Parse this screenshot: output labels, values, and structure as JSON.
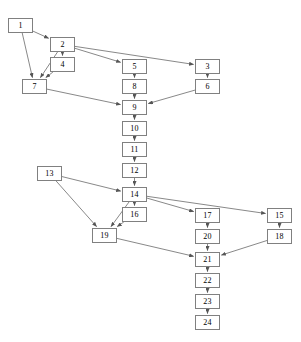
{
  "diagram": {
    "type": "directed-graph",
    "width": 301,
    "height": 342,
    "background_color": "#ffffff",
    "node_fill_color": "#ffffff",
    "node_border_color": "#808080",
    "edge_color": "#555555",
    "label_color": "#000000",
    "node_width": 25,
    "node_height": 15,
    "nodes": [
      {
        "id": "1",
        "label": "1",
        "x": 8,
        "y": 18
      },
      {
        "id": "2",
        "label": "2",
        "x": 50,
        "y": 37
      },
      {
        "id": "3",
        "label": "3",
        "x": 195,
        "y": 59
      },
      {
        "id": "4",
        "label": "4",
        "x": 50,
        "y": 57
      },
      {
        "id": "5",
        "label": "5",
        "x": 122,
        "y": 59
      },
      {
        "id": "6",
        "label": "6",
        "x": 195,
        "y": 79
      },
      {
        "id": "7",
        "label": "7",
        "x": 22,
        "y": 79
      },
      {
        "id": "8",
        "label": "8",
        "x": 122,
        "y": 79
      },
      {
        "id": "9",
        "label": "9",
        "x": 122,
        "y": 100
      },
      {
        "id": "10",
        "label": "10",
        "x": 122,
        "y": 121
      },
      {
        "id": "11",
        "label": "11",
        "x": 122,
        "y": 142
      },
      {
        "id": "12",
        "label": "12",
        "x": 122,
        "y": 163
      },
      {
        "id": "13",
        "label": "13",
        "x": 37,
        "y": 166
      },
      {
        "id": "14",
        "label": "14",
        "x": 122,
        "y": 187
      },
      {
        "id": "15",
        "label": "15",
        "x": 267,
        "y": 208
      },
      {
        "id": "16",
        "label": "16",
        "x": 122,
        "y": 207
      },
      {
        "id": "17",
        "label": "17",
        "x": 195,
        "y": 208
      },
      {
        "id": "18",
        "label": "18",
        "x": 267,
        "y": 229
      },
      {
        "id": "19",
        "label": "19",
        "x": 92,
        "y": 228
      },
      {
        "id": "20",
        "label": "20",
        "x": 195,
        "y": 229
      },
      {
        "id": "21",
        "label": "21",
        "x": 195,
        "y": 252
      },
      {
        "id": "22",
        "label": "22",
        "x": 195,
        "y": 273
      },
      {
        "id": "23",
        "label": "23",
        "x": 195,
        "y": 294
      },
      {
        "id": "24",
        "label": "24",
        "x": 195,
        "y": 315
      }
    ],
    "edges": [
      {
        "from": "1",
        "to": "2"
      },
      {
        "from": "1",
        "to": "7"
      },
      {
        "from": "2",
        "to": "4"
      },
      {
        "from": "2",
        "to": "7"
      },
      {
        "from": "2",
        "to": "5"
      },
      {
        "from": "2",
        "to": "3"
      },
      {
        "from": "4",
        "to": "7"
      },
      {
        "from": "3",
        "to": "6"
      },
      {
        "from": "5",
        "to": "8"
      },
      {
        "from": "7",
        "to": "9"
      },
      {
        "from": "8",
        "to": "9"
      },
      {
        "from": "6",
        "to": "9"
      },
      {
        "from": "9",
        "to": "10"
      },
      {
        "from": "10",
        "to": "11"
      },
      {
        "from": "11",
        "to": "12"
      },
      {
        "from": "12",
        "to": "14"
      },
      {
        "from": "13",
        "to": "14"
      },
      {
        "from": "13",
        "to": "19"
      },
      {
        "from": "14",
        "to": "16"
      },
      {
        "from": "14",
        "to": "17"
      },
      {
        "from": "14",
        "to": "15"
      },
      {
        "from": "14",
        "to": "19"
      },
      {
        "from": "16",
        "to": "19"
      },
      {
        "from": "19",
        "to": "21"
      },
      {
        "from": "17",
        "to": "20"
      },
      {
        "from": "20",
        "to": "21"
      },
      {
        "from": "15",
        "to": "18"
      },
      {
        "from": "18",
        "to": "21"
      },
      {
        "from": "21",
        "to": "22"
      },
      {
        "from": "22",
        "to": "23"
      },
      {
        "from": "23",
        "to": "24"
      }
    ]
  }
}
